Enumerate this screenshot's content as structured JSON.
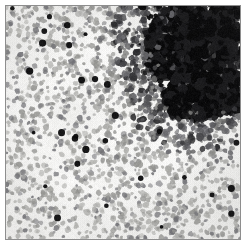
{
  "figure": {
    "kind": "micrograph",
    "modality": "brightfield-histology",
    "channel": "grayscale",
    "width": 247,
    "height": 246,
    "caption": "",
    "title": "",
    "scalebar_label": ""
  },
  "frame": {
    "outer_margin_px": 5,
    "border_width_px": 1,
    "border_color": "#8e8e8e",
    "outer_background": "#ffffff",
    "field_background": "#f6f5f3",
    "field_left": 6,
    "field_top": 6,
    "field_width": 234,
    "field_height": 233
  },
  "palette": {
    "background": "#f6f5f3",
    "background_mottle_light": "#fbfbfa",
    "background_mottle_dark": "#ececea",
    "nucleus_light": "#b4b4b1",
    "nucleus_mid": "#9a9a97",
    "nucleus_dark": "#76767a",
    "nucleus_deep": "#4a4a4e",
    "infiltrate_dark": "#1c1c1e",
    "infiltrate_black": "#0a0a0b",
    "border": "#8e8e8e"
  },
  "field": {
    "description": "Dense scatter of small rounded nuclei on a pale ground, with a confluent dark-staining cluster occupying the upper-right quadrant and tapering down the right margin.",
    "sparse_cell_count": 2300,
    "cell_radius_min_px": 1.4,
    "cell_radius_max_px": 3.2,
    "dark_point_cell_count": 34
  },
  "regions": [
    {
      "name": "diffuse-field",
      "label": "Diffuse scattered nuclei",
      "cx": 0.42,
      "cy": 0.55,
      "density": 1.0,
      "tone": "mid-gray"
    },
    {
      "name": "dense-infiltrate",
      "label": "Dense dark infiltrate",
      "cx": 0.87,
      "cy": 0.11,
      "radius": 0.3,
      "density": 2.6,
      "tone": "near-black"
    },
    {
      "name": "right-margin-tail",
      "label": "Tapering dark tail",
      "cx": 0.93,
      "cy": 0.34,
      "radius": 0.22,
      "density": 1.6,
      "tone": "dark-gray"
    },
    {
      "name": "lower-right-band",
      "label": "Lower right streak",
      "cx": 0.68,
      "cy": 0.52,
      "radius": 0.14,
      "density": 1.3,
      "tone": "dark-gray"
    }
  ],
  "noise": {
    "grain_amplitude": 9,
    "mottle_scale_px": 26,
    "mottle_amplitude": 6,
    "seed": 20240517
  }
}
